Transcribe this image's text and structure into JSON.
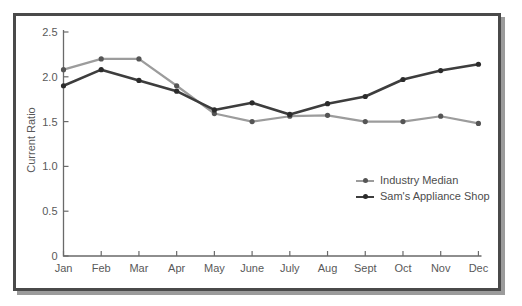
{
  "colors": {
    "frame_border": "#4a4a4a",
    "frame_shadow": "#9b9b9b",
    "axis": "#6a6a6a",
    "tick_text": "#595959",
    "legend_text": "#4d4d4d",
    "background": "#ffffff"
  },
  "chart_data": {
    "type": "line",
    "title": "",
    "xlabel": "",
    "ylabel": "Current Ratio",
    "ylim": [
      0,
      2.5
    ],
    "yticks": [
      0,
      0.5,
      1.0,
      1.5,
      2.0,
      2.5
    ],
    "ytick_labels": [
      "0",
      "0.5",
      "1.0",
      "1.5",
      "2.0",
      "2.5"
    ],
    "categories": [
      "Jan",
      "Feb",
      "Mar",
      "Apr",
      "May",
      "June",
      "July",
      "Aug",
      "Sept",
      "Oct",
      "Nov",
      "Dec"
    ],
    "series": [
      {
        "name": "Industry Median",
        "color": "#9c9c9c",
        "marker_color": "#555555",
        "values": [
          2.08,
          2.2,
          2.2,
          1.9,
          1.59,
          1.5,
          1.56,
          1.57,
          1.5,
          1.5,
          1.56,
          1.48
        ]
      },
      {
        "name": "Sam's Appliance Shop",
        "color": "#3d3d3d",
        "marker_color": "#2b2b2b",
        "values": [
          1.9,
          2.08,
          1.96,
          1.84,
          1.63,
          1.71,
          1.58,
          1.7,
          1.78,
          1.97,
          2.07,
          2.14
        ]
      }
    ],
    "legend_position": "right-middle",
    "grid": false
  }
}
